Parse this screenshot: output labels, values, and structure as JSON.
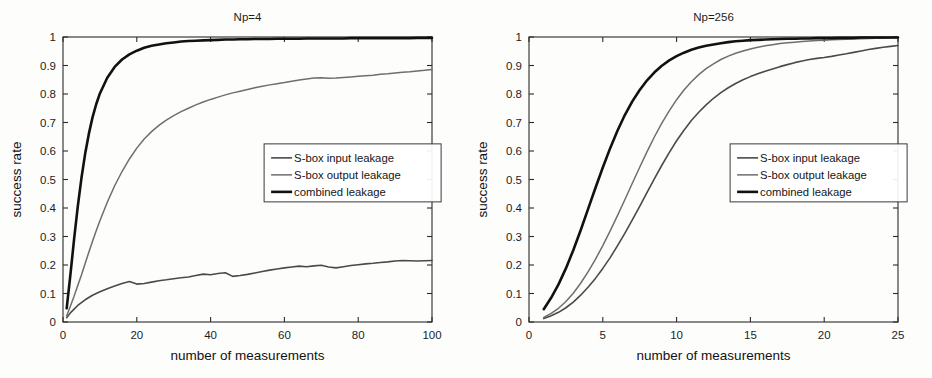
{
  "figure": {
    "background": "#fdfdfc",
    "axis_color": "#2b2b2b",
    "text_color": "#1d1d1d"
  },
  "series_style": {
    "sbox_input": {
      "color": "#4a4a4a",
      "width": 1.6
    },
    "sbox_output": {
      "color": "#6e6e6e",
      "width": 1.5
    },
    "combined": {
      "color": "#111111",
      "width": 2.6
    }
  },
  "legend": {
    "position": "center-right",
    "entries": [
      {
        "label": "S-box input leakage",
        "key": "sbox_input"
      },
      {
        "label": "S-box output leakage",
        "key": "sbox_output"
      },
      {
        "label": "combined leakage",
        "key": "combined"
      }
    ]
  },
  "chart_data": [
    {
      "id": "np4",
      "type": "line",
      "title": "Np=4",
      "xlabel": "number of measurements",
      "ylabel": "success rate",
      "xlim": [
        0,
        100
      ],
      "ylim": [
        0,
        1
      ],
      "xticks": [
        0,
        20,
        40,
        60,
        80,
        100
      ],
      "xtick_labels": [
        "0",
        "20",
        "40",
        "60",
        "80",
        "100"
      ],
      "yticks": [
        0,
        0.1,
        0.2,
        0.3,
        0.4,
        0.5,
        0.6,
        0.7,
        0.8,
        0.9,
        1
      ],
      "ytick_labels": [
        "0",
        "0.1",
        "0.2",
        "0.3",
        "0.4",
        "0.5",
        "0.6",
        "0.7",
        "0.8",
        "0.9",
        "1"
      ],
      "grid": false,
      "legend_position": "center-right",
      "x": [
        1,
        2,
        3,
        4,
        5,
        6,
        7,
        8,
        9,
        10,
        12,
        14,
        16,
        18,
        20,
        22,
        24,
        26,
        28,
        30,
        32,
        34,
        36,
        38,
        40,
        42,
        44,
        46,
        48,
        50,
        52,
        54,
        56,
        58,
        60,
        62,
        64,
        66,
        68,
        70,
        72,
        74,
        76,
        78,
        80,
        82,
        84,
        86,
        88,
        90,
        92,
        94,
        96,
        98,
        100
      ],
      "series": [
        {
          "name": "S-box input leakage",
          "key": "sbox_input",
          "values": [
            0.015,
            0.032,
            0.045,
            0.058,
            0.068,
            0.078,
            0.086,
            0.094,
            0.1,
            0.106,
            0.117,
            0.126,
            0.135,
            0.142,
            0.133,
            0.135,
            0.14,
            0.145,
            0.148,
            0.152,
            0.155,
            0.158,
            0.163,
            0.168,
            0.166,
            0.17,
            0.173,
            0.16,
            0.163,
            0.167,
            0.172,
            0.177,
            0.182,
            0.186,
            0.19,
            0.193,
            0.196,
            0.194,
            0.197,
            0.199,
            0.193,
            0.19,
            0.194,
            0.198,
            0.201,
            0.204,
            0.206,
            0.209,
            0.211,
            0.214,
            0.216,
            0.215,
            0.214,
            0.215,
            0.216
          ]
        },
        {
          "name": "S-box output leakage",
          "key": "sbox_output",
          "values": [
            0.022,
            0.055,
            0.09,
            0.128,
            0.165,
            0.205,
            0.245,
            0.283,
            0.32,
            0.355,
            0.42,
            0.478,
            0.528,
            0.572,
            0.61,
            0.642,
            0.668,
            0.69,
            0.708,
            0.724,
            0.738,
            0.75,
            0.762,
            0.772,
            0.781,
            0.789,
            0.797,
            0.804,
            0.81,
            0.816,
            0.822,
            0.827,
            0.832,
            0.836,
            0.84,
            0.845,
            0.849,
            0.853,
            0.856,
            0.857,
            0.855,
            0.856,
            0.858,
            0.86,
            0.862,
            0.864,
            0.866,
            0.869,
            0.871,
            0.874,
            0.876,
            0.878,
            0.881,
            0.883,
            0.886
          ]
        },
        {
          "name": "combined leakage",
          "key": "combined",
          "values": [
            0.048,
            0.165,
            0.29,
            0.405,
            0.505,
            0.59,
            0.66,
            0.718,
            0.764,
            0.802,
            0.857,
            0.895,
            0.921,
            0.939,
            0.952,
            0.962,
            0.969,
            0.974,
            0.978,
            0.981,
            0.984,
            0.986,
            0.987,
            0.988,
            0.989,
            0.99,
            0.991,
            0.991,
            0.992,
            0.992,
            0.993,
            0.993,
            0.993,
            0.994,
            0.994,
            0.994,
            0.994,
            0.995,
            0.995,
            0.995,
            0.995,
            0.995,
            0.995,
            0.996,
            0.996,
            0.996,
            0.996,
            0.996,
            0.996,
            0.996,
            0.996,
            0.996,
            0.997,
            0.997,
            0.997
          ]
        }
      ]
    },
    {
      "id": "np256",
      "type": "line",
      "title": "Np=256",
      "xlabel": "number of measurements",
      "ylabel": "success rate",
      "xlim": [
        0,
        25
      ],
      "ylim": [
        0,
        1
      ],
      "xticks": [
        0,
        5,
        10,
        15,
        20,
        25
      ],
      "xtick_labels": [
        "0",
        "5",
        "10",
        "15",
        "20",
        "25"
      ],
      "yticks": [
        0,
        0.1,
        0.2,
        0.3,
        0.4,
        0.5,
        0.6,
        0.7,
        0.8,
        0.9,
        1
      ],
      "ytick_labels": [
        "0",
        "0.1",
        "0.2",
        "0.3",
        "0.4",
        "0.5",
        "0.6",
        "0.7",
        "0.8",
        "0.9",
        "1"
      ],
      "grid": false,
      "legend_position": "center-right",
      "x": [
        1,
        1.5,
        2,
        2.5,
        3,
        3.5,
        4,
        4.5,
        5,
        5.5,
        6,
        6.5,
        7,
        7.5,
        8,
        8.5,
        9,
        9.5,
        10,
        10.5,
        11,
        11.5,
        12,
        12.5,
        13,
        13.5,
        14,
        14.5,
        15,
        15.5,
        16,
        16.5,
        17,
        17.5,
        18,
        18.5,
        19,
        19.5,
        20,
        20.5,
        21,
        21.5,
        22,
        22.5,
        23,
        23.5,
        24,
        24.5,
        25
      ],
      "series": [
        {
          "name": "S-box input leakage",
          "key": "sbox_input",
          "values": [
            0.012,
            0.022,
            0.034,
            0.05,
            0.07,
            0.094,
            0.122,
            0.153,
            0.188,
            0.226,
            0.268,
            0.312,
            0.358,
            0.406,
            0.455,
            0.503,
            0.55,
            0.594,
            0.636,
            0.673,
            0.707,
            0.736,
            0.762,
            0.785,
            0.805,
            0.822,
            0.837,
            0.85,
            0.861,
            0.871,
            0.88,
            0.888,
            0.896,
            0.903,
            0.91,
            0.916,
            0.921,
            0.925,
            0.928,
            0.932,
            0.937,
            0.941,
            0.946,
            0.951,
            0.956,
            0.96,
            0.964,
            0.967,
            0.97
          ]
        },
        {
          "name": "S-box output leakage",
          "key": "sbox_output",
          "values": [
            0.016,
            0.03,
            0.048,
            0.072,
            0.101,
            0.136,
            0.176,
            0.22,
            0.268,
            0.32,
            0.374,
            0.43,
            0.487,
            0.543,
            0.598,
            0.65,
            0.698,
            0.741,
            0.78,
            0.814,
            0.843,
            0.868,
            0.889,
            0.906,
            0.921,
            0.933,
            0.943,
            0.951,
            0.958,
            0.964,
            0.969,
            0.973,
            0.977,
            0.98,
            0.982,
            0.984,
            0.986,
            0.988,
            0.989,
            0.99,
            0.991,
            0.992,
            0.993,
            0.994,
            0.995,
            0.996,
            0.996,
            0.997,
            0.997
          ]
        },
        {
          "name": "combined leakage",
          "key": "combined",
          "values": [
            0.045,
            0.085,
            0.132,
            0.188,
            0.252,
            0.322,
            0.396,
            0.47,
            0.542,
            0.61,
            0.672,
            0.727,
            0.774,
            0.814,
            0.848,
            0.876,
            0.899,
            0.918,
            0.933,
            0.945,
            0.955,
            0.963,
            0.969,
            0.974,
            0.978,
            0.982,
            0.985,
            0.987,
            0.989,
            0.99,
            0.991,
            0.992,
            0.993,
            0.994,
            0.994,
            0.995,
            0.995,
            0.996,
            0.996,
            0.996,
            0.997,
            0.997,
            0.997,
            0.998,
            0.998,
            0.998,
            0.998,
            0.998,
            0.998
          ]
        }
      ]
    }
  ]
}
